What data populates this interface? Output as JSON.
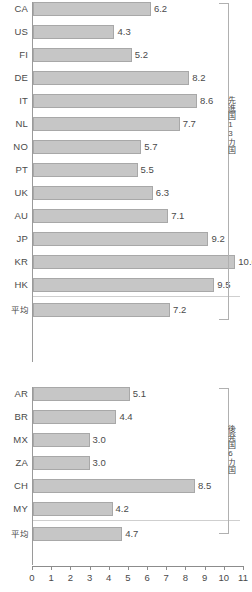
{
  "chart_data": {
    "type": "bar",
    "orientation": "horizontal",
    "title": "",
    "xlabel": "",
    "ylabel": "",
    "xlim": [
      0,
      11
    ],
    "xticks": [
      0,
      1,
      2,
      3,
      4,
      5,
      6,
      7,
      8,
      9,
      10,
      11
    ],
    "xtick_labels": [
      "0",
      "1",
      "2",
      "3",
      "4",
      "5",
      "6",
      "7",
      "8",
      "9",
      "10",
      "11"
    ],
    "grid": false,
    "legend": "none",
    "bar_color": "#c6c6c6",
    "bar_edge_color": "#a8a8a8",
    "groups": [
      {
        "id": "advanced",
        "annotation": "先進国13カ国",
        "categories": [
          "CA",
          "US",
          "FI",
          "DE",
          "IT",
          "NL",
          "NO",
          "PT",
          "UK",
          "AU",
          "JP",
          "KR",
          "HK"
        ],
        "values": [
          6.2,
          4.3,
          5.2,
          8.2,
          8.6,
          7.7,
          5.7,
          5.5,
          6.3,
          7.1,
          9.2,
          10.6,
          9.5
        ],
        "value_labels": [
          "6.2",
          "4.3",
          "5.2",
          "8.2",
          "8.6",
          "7.7",
          "5.7",
          "5.5",
          "6.3",
          "7.1",
          "9.2",
          "10.6",
          "9.5"
        ],
        "average_label": "平均",
        "average_value": 7.2,
        "average_value_label": "7.2"
      },
      {
        "id": "developing",
        "annotation": "後発国6カ国",
        "categories": [
          "AR",
          "BR",
          "MX",
          "ZA",
          "CH",
          "MY"
        ],
        "values": [
          5.1,
          4.4,
          3.0,
          3.0,
          8.5,
          4.2
        ],
        "value_labels": [
          "5.1",
          "4.4",
          "3.0",
          "3.0",
          "8.5",
          "4.2"
        ],
        "average_label": "平均",
        "average_value": 4.7,
        "average_value_label": "4.7"
      }
    ]
  }
}
